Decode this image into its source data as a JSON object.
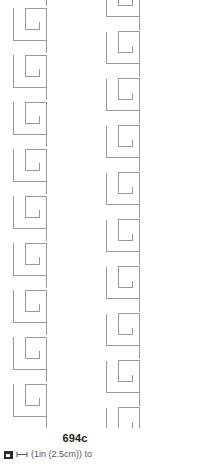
{
  "swatch": {
    "code": "694c",
    "icon_name": "swatch-thumbnail-icon",
    "dimension_icon_name": "dimension-arrow-icon",
    "size_note": "(1in (2.5cm)) to",
    "line_color": "#999999",
    "background_color": "#ffffff",
    "code_color": "#231f20",
    "note_color": "#58595b"
  },
  "pattern": {
    "name": "greek-key-meander",
    "description": "Repeating Greek key / fret spiral motif in light grey outline",
    "stroke_color": "#999999",
    "stroke_width": 1,
    "columns_x": [
      13,
      106,
      199
    ],
    "row_pitch": 47,
    "rows": 9,
    "motif": {
      "width": 47,
      "height": 47,
      "points": "0,8 0,40 33,40 33,47 33,16 12,16 12,31 25,31 25,24"
    }
  }
}
